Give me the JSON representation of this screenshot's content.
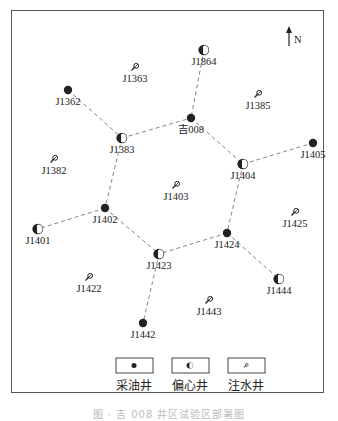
{
  "north": {
    "label": "N"
  },
  "wells": [
    {
      "id": "J1363",
      "type": "injector",
      "x": 135,
      "y": 67
    },
    {
      "id": "J1864",
      "type": "eccentric",
      "x": 204,
      "y": 50
    },
    {
      "id": "J1362",
      "type": "producer",
      "x": 68,
      "y": 90
    },
    {
      "id": "J1385",
      "type": "injector",
      "x": 258,
      "y": 94
    },
    {
      "id": "吉008",
      "type": "producer",
      "x": 191,
      "y": 118
    },
    {
      "id": "J1383",
      "type": "eccentric",
      "x": 122,
      "y": 138
    },
    {
      "id": "J1405",
      "type": "producer",
      "x": 313,
      "y": 143
    },
    {
      "id": "J1382",
      "type": "injector",
      "x": 54,
      "y": 159
    },
    {
      "id": "J1404",
      "type": "eccentric",
      "x": 243,
      "y": 164
    },
    {
      "id": "J1403",
      "type": "injector",
      "x": 176,
      "y": 185
    },
    {
      "id": "J1402",
      "type": "producer",
      "x": 105,
      "y": 208
    },
    {
      "id": "J1425",
      "type": "injector",
      "x": 295,
      "y": 212
    },
    {
      "id": "J1401",
      "type": "eccentric",
      "x": 38,
      "y": 229
    },
    {
      "id": "J1424",
      "type": "producer",
      "x": 227,
      "y": 233
    },
    {
      "id": "J1423",
      "type": "eccentric",
      "x": 159,
      "y": 254
    },
    {
      "id": "J1444",
      "type": "eccentric",
      "x": 279,
      "y": 279
    },
    {
      "id": "J1422",
      "type": "injector",
      "x": 89,
      "y": 277
    },
    {
      "id": "J1443",
      "type": "injector",
      "x": 209,
      "y": 300
    },
    {
      "id": "J1442",
      "type": "producer",
      "x": 143,
      "y": 323
    }
  ],
  "connections": [
    [
      "J1362",
      "J1383"
    ],
    [
      "J1383",
      "吉008"
    ],
    [
      "J1864",
      "吉008"
    ],
    [
      "吉008",
      "J1404"
    ],
    [
      "J1404",
      "J1405"
    ],
    [
      "J1383",
      "J1402"
    ],
    [
      "J1402",
      "J1401"
    ],
    [
      "J1402",
      "J1423"
    ],
    [
      "J1404",
      "J1424"
    ],
    [
      "J1424",
      "J1423"
    ],
    [
      "J1424",
      "J1444"
    ],
    [
      "J1423",
      "J1442"
    ]
  ],
  "legend": [
    {
      "type": "producer",
      "label": "采油井"
    },
    {
      "type": "eccentric",
      "label": "偏心井"
    },
    {
      "type": "injector",
      "label": "注水井"
    }
  ],
  "caption": "图 ·  吉 008 井区试验区部署图"
}
